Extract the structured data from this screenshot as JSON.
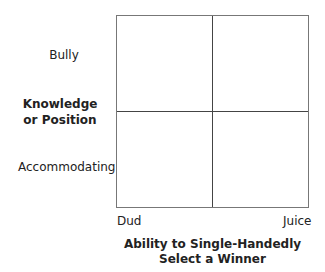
{
  "y_axis": {
    "top_label": "Bully",
    "title_line1": "Knowledge",
    "title_line2": "or Position",
    "bottom_label": "Accommodating"
  },
  "x_axis": {
    "left_label": "Dud",
    "right_label": "Juice",
    "title_line1": "Ability to Single-Handedly",
    "title_line2": "Select a Winner"
  },
  "quadrants": [
    "",
    "",
    "",
    ""
  ]
}
